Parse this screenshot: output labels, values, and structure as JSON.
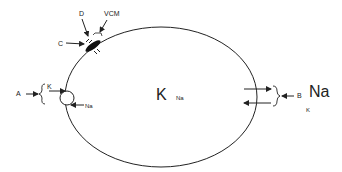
{
  "diagram": {
    "type": "cell-membrane-transport",
    "colors": {
      "stroke": "#222222",
      "background": "#ffffff"
    },
    "labels": {
      "A": "A",
      "B": "B",
      "C": "C",
      "D": "D",
      "VCM": "VCM",
      "left_K": "K",
      "left_Na": "Na",
      "center_K": "K",
      "center_Na": "Na",
      "right_Na": "Na",
      "right_K": "K"
    },
    "nodes": [
      {
        "id": "cell",
        "shape": "ellipse",
        "label": ""
      },
      {
        "id": "A",
        "label": "A",
        "points_to": "left carrier loop (K in, Na out)"
      },
      {
        "id": "B",
        "label": "B",
        "points_to": "right channel pair (Na in, K out)"
      },
      {
        "id": "C",
        "label": "C",
        "points_to": "membrane structure"
      },
      {
        "id": "D",
        "label": "D",
        "points_to": "membrane structure"
      },
      {
        "id": "VCM",
        "label": "VCM",
        "points_to": "membrane structure"
      }
    ]
  }
}
